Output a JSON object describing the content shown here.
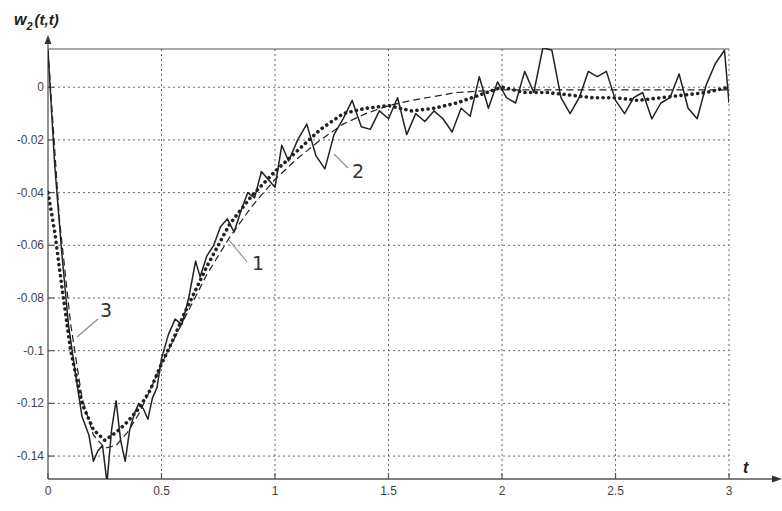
{
  "chart_data": {
    "type": "line",
    "title": "",
    "xlabel": "t",
    "ylabel": "w2(t,t)",
    "ylabel_parts": {
      "base": "w",
      "sub": "2",
      "args": "(t,t)"
    },
    "xlim": [
      0,
      3
    ],
    "ylim": [
      -0.1487,
      0.0145
    ],
    "grid": true,
    "legend": "none (curves labelled by numbered leader lines 1, 2, 3)",
    "x_ticks": [
      0,
      0.5,
      1,
      1.5,
      2,
      2.5,
      3
    ],
    "x_tick_labels": [
      "0",
      "0.5",
      "1",
      "1.5",
      "2",
      "2.5",
      "3"
    ],
    "y_ticks": [
      0,
      -0.02,
      -0.04,
      -0.06,
      -0.08,
      -0.1,
      -0.12,
      -0.14
    ],
    "y_tick_labels": [
      "0",
      "-0.02",
      "-0.04",
      "-0.06",
      "-0.08",
      "-0.1",
      "-0.12",
      "-0.14"
    ],
    "series": [
      {
        "name": "1",
        "style": "dashed",
        "description": "smooth reference curve",
        "x": [
          0,
          0.05,
          0.1,
          0.15,
          0.2,
          0.25,
          0.3,
          0.35,
          0.4,
          0.45,
          0.5,
          0.6,
          0.7,
          0.8,
          0.9,
          1.0,
          1.1,
          1.2,
          1.3,
          1.4,
          1.5,
          1.6,
          1.8,
          2.0,
          2.2,
          2.5,
          2.8,
          3.0
        ],
        "y": [
          0.014,
          -0.05,
          -0.09,
          -0.118,
          -0.132,
          -0.137,
          -0.136,
          -0.131,
          -0.124,
          -0.115,
          -0.105,
          -0.088,
          -0.071,
          -0.057,
          -0.045,
          -0.035,
          -0.027,
          -0.02,
          -0.014,
          -0.01,
          -0.007,
          -0.005,
          -0.002,
          -0.001,
          -0.001,
          -0.001,
          -0.001,
          -0.001
        ]
      },
      {
        "name": "2",
        "style": "solid",
        "description": "noisy estimate",
        "x": [
          0,
          0.03,
          0.06,
          0.09,
          0.12,
          0.15,
          0.18,
          0.2,
          0.22,
          0.24,
          0.26,
          0.28,
          0.3,
          0.32,
          0.34,
          0.36,
          0.38,
          0.4,
          0.42,
          0.44,
          0.46,
          0.48,
          0.5,
          0.53,
          0.56,
          0.59,
          0.62,
          0.65,
          0.67,
          0.7,
          0.73,
          0.76,
          0.79,
          0.82,
          0.85,
          0.88,
          0.91,
          0.94,
          0.97,
          1.0,
          1.03,
          1.06,
          1.1,
          1.14,
          1.18,
          1.22,
          1.26,
          1.3,
          1.34,
          1.38,
          1.42,
          1.46,
          1.5,
          1.54,
          1.58,
          1.62,
          1.66,
          1.7,
          1.74,
          1.78,
          1.82,
          1.86,
          1.9,
          1.94,
          1.98,
          2.02,
          2.06,
          2.1,
          2.14,
          2.18,
          2.22,
          2.26,
          2.3,
          2.34,
          2.38,
          2.42,
          2.46,
          2.5,
          2.54,
          2.58,
          2.62,
          2.66,
          2.7,
          2.74,
          2.78,
          2.82,
          2.86,
          2.9,
          2.94,
          2.98,
          3.0
        ],
        "y": [
          0.014,
          -0.03,
          -0.062,
          -0.09,
          -0.108,
          -0.125,
          -0.132,
          -0.142,
          -0.138,
          -0.136,
          -0.15,
          -0.13,
          -0.119,
          -0.134,
          -0.142,
          -0.13,
          -0.124,
          -0.12,
          -0.122,
          -0.126,
          -0.118,
          -0.114,
          -0.103,
          -0.094,
          -0.088,
          -0.09,
          -0.08,
          -0.066,
          -0.072,
          -0.064,
          -0.06,
          -0.053,
          -0.05,
          -0.055,
          -0.047,
          -0.04,
          -0.042,
          -0.032,
          -0.035,
          -0.038,
          -0.022,
          -0.028,
          -0.02,
          -0.014,
          -0.026,
          -0.031,
          -0.018,
          -0.012,
          -0.005,
          -0.015,
          -0.016,
          -0.009,
          -0.012,
          -0.004,
          -0.018,
          -0.01,
          -0.013,
          -0.009,
          -0.012,
          -0.017,
          -0.008,
          -0.011,
          0.004,
          -0.008,
          0.002,
          -0.004,
          -0.006,
          0.006,
          -0.002,
          0.015,
          0.014,
          -0.004,
          -0.01,
          -0.004,
          0.006,
          0.004,
          0.006,
          -0.005,
          -0.01,
          -0.004,
          -0.002,
          -0.012,
          -0.006,
          -0.004,
          0.005,
          -0.008,
          -0.012,
          0.001,
          0.009,
          0.014,
          -0.006
        ]
      },
      {
        "name": "3",
        "style": "dotted",
        "description": "smoothed estimate",
        "x": [
          0,
          0.03,
          0.06,
          0.1,
          0.15,
          0.2,
          0.25,
          0.3,
          0.35,
          0.4,
          0.45,
          0.5,
          0.55,
          0.6,
          0.65,
          0.7,
          0.75,
          0.8,
          0.9,
          1.0,
          1.1,
          1.2,
          1.3,
          1.4,
          1.5,
          1.6,
          1.7,
          1.8,
          1.9,
          2.0,
          2.1,
          2.2,
          2.3,
          2.4,
          2.5,
          2.6,
          2.7,
          2.8,
          2.9,
          3.0
        ],
        "y": [
          -0.04,
          -0.055,
          -0.075,
          -0.1,
          -0.12,
          -0.13,
          -0.134,
          -0.131,
          -0.127,
          -0.122,
          -0.115,
          -0.105,
          -0.096,
          -0.086,
          -0.077,
          -0.068,
          -0.06,
          -0.052,
          -0.041,
          -0.032,
          -0.024,
          -0.016,
          -0.01,
          -0.008,
          -0.007,
          -0.009,
          -0.008,
          -0.006,
          -0.003,
          0.0,
          -0.002,
          -0.002,
          -0.003,
          -0.004,
          -0.004,
          -0.005,
          -0.004,
          -0.003,
          -0.002,
          0.0
        ]
      }
    ],
    "annotations": [
      {
        "text": "1",
        "label_xy_px": [
          252,
          270
        ],
        "line_from_px": [
          247,
          262
        ],
        "line_to_px": [
          229,
          240
        ],
        "target_series": "1"
      },
      {
        "text": "2",
        "label_xy_px": [
          352,
          178
        ],
        "line_from_px": [
          348,
          168
        ],
        "line_to_px": [
          334,
          154
        ],
        "target_series": "2"
      },
      {
        "text": "3",
        "label_xy_px": [
          100,
          317
        ],
        "line_from_px": [
          98,
          319
        ],
        "line_to_px": [
          77,
          337
        ],
        "target_series": "3"
      }
    ]
  },
  "colors": {
    "frame": "#555555",
    "grid": "#666666",
    "curve": "#222222",
    "leader": "#888888",
    "background": "#ffffff"
  }
}
